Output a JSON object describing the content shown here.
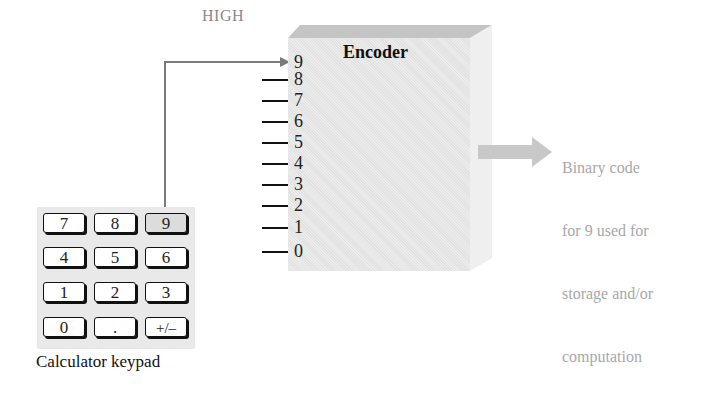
{
  "diagram": {
    "signal_label": "HIGH",
    "encoder": {
      "title": "Encoder",
      "inputs": [
        "9",
        "8",
        "7",
        "6",
        "5",
        "4",
        "3",
        "2",
        "1",
        "0"
      ],
      "active_input": "9"
    },
    "output": {
      "lines": [
        "Binary code",
        "for 9 used for",
        "storage and/or",
        "computation"
      ]
    },
    "keypad": {
      "caption": "Calculator keypad",
      "keys": [
        [
          "7",
          "8",
          "9"
        ],
        [
          "4",
          "5",
          "6"
        ],
        [
          "1",
          "2",
          "3"
        ],
        [
          "0",
          ".",
          "+/–"
        ]
      ],
      "pressed_key": "9"
    },
    "colors": {
      "encoder_face": "#e6e6e6",
      "encoder_top": "#c4c4c4",
      "encoder_side": "#f0f0f0",
      "wire": "#7a7a7a",
      "output_arrow": "#c8c8c8",
      "output_text": "#a8a8a8",
      "keypad_bg": "#e9e9e9",
      "pressed_key": "#dcdcdc"
    }
  }
}
